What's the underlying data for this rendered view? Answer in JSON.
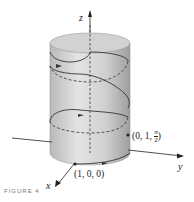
{
  "figure": {
    "axes": {
      "x": "x",
      "y": "y",
      "z": "z"
    },
    "points": [
      {
        "label": "(1, 0, 0)"
      },
      {
        "label": "(0, 1, π/2)",
        "pre": "(0, 1, ",
        "num": "π",
        "den": "2",
        "post": ")"
      }
    ],
    "caption": "FIGURE 4",
    "colors": {
      "cylinder": "#c8c8c8",
      "curve": "#333333",
      "axis": "#222222"
    }
  }
}
